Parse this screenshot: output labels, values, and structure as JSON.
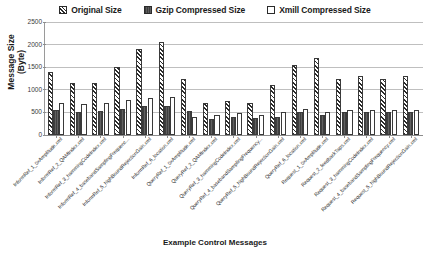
{
  "legend": {
    "position": "top-center",
    "items": [
      {
        "label": "Original Size",
        "marker": "diagonal-hatch-swatch",
        "color": "#2b2b2b"
      },
      {
        "label": "Gzip Compressed Size",
        "marker": "dark-fill-swatch",
        "color": "#4e4e4e"
      },
      {
        "label": "Xmill Compressed Size",
        "marker": "white-fill-swatch",
        "color": "#ffffff"
      }
    ]
  },
  "axes": {
    "ylabel_line1": "Message Size",
    "ylabel_line2": "(Byte)",
    "xlabel": "Example Control Messages",
    "yticks": [
      "0",
      "500",
      "1000",
      "1500",
      "2000",
      "2500"
    ],
    "ymin": 0,
    "ymax": 2500
  },
  "chart_data": {
    "type": "bar",
    "title": "",
    "xlabel": "Example Control Messages",
    "ylabel": "Message Size (Byte)",
    "ylim": [
      0,
      2500
    ],
    "ytick_interval": 500,
    "grid": true,
    "legend_position": "top-center",
    "categories": [
      "InformRef_1_0xAmplitude.xml",
      "InformRef_2_QAMIndex.xml",
      "InformRef_3_hammingCodeIndex.xml",
      "InformRef_4_basebandSamplingFrequenc...",
      "InformRef_5_highBoundRejectionGain.xml",
      "InformRef_6_location.xml",
      "QueryRef_1_0xAmplitude.xml",
      "QueryRef_2_QAMIndex.xml",
      "QueryRef_3_hammingCodeIndex.xml",
      "QueryRef_4_basebandSamplingFrequency...",
      "QueryRef_5_highBoundRejectionGain.xml",
      "QueryRef_6_location.xml",
      "Request_1_0xAmplitude.xml",
      "Request_2_feedbackTaps.xml",
      "Request_3_hammingCodeIndex.xml",
      "Request_4_basebandSamplingFrequency.xml",
      "Request_5_highBoundRejectionGain.xml"
    ],
    "series": [
      {
        "name": "Original Size",
        "values": [
          1400,
          1150,
          1150,
          1500,
          1900,
          2050,
          1250,
          700,
          750,
          700,
          1100,
          1550,
          1700,
          1250,
          1300,
          1250,
          1300
        ]
      },
      {
        "name": "Gzip Compressed Size",
        "values": [
          550,
          520,
          530,
          570,
          650,
          650,
          530,
          350,
          400,
          380,
          400,
          500,
          450,
          500,
          520,
          500,
          520
        ]
      },
      {
        "name": "Xmill Compressed Size",
        "values": [
          700,
          680,
          700,
          780,
          820,
          830,
          400,
          450,
          480,
          450,
          500,
          580,
          520,
          550,
          560,
          560,
          560
        ]
      }
    ]
  }
}
